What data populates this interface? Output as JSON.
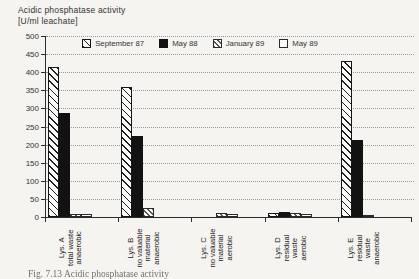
{
  "page": {
    "background": "#f5f4f0",
    "caption_fragment": "Fig. 7.13  Acidic phosphatase activity"
  },
  "chart_data": {
    "type": "bar",
    "title_line1": "Acidic phosphatase activity",
    "title_line2": "[U/ml leachate]",
    "ylabel": "",
    "xlabel": "",
    "ylim": [
      0,
      500
    ],
    "ytick_step": 50,
    "grid": "horizontal-dotted",
    "legend_position": "top-inside",
    "axis_color": "#2b2b2b",
    "grid_color": "#9a9a96",
    "categories": [
      {
        "lines": [
          "Lys. A",
          "total waste",
          "anaerobic"
        ]
      },
      {
        "lines": [
          "Lys. B",
          "no valuable",
          "material",
          "anaerobic"
        ]
      },
      {
        "lines": [
          "Lys. C",
          "no valuable",
          "material",
          "aerobic"
        ]
      },
      {
        "lines": [
          "Lys. D",
          "residual",
          "waste",
          "aerobic"
        ]
      },
      {
        "lines": [
          "Lys. E",
          "residual",
          "waste",
          "anaerobic"
        ]
      }
    ],
    "series": [
      {
        "name": "September 87",
        "pattern": "diagonal-hatch",
        "color": "#1e1e1e",
        "values": [
          415,
          360,
          0,
          10,
          430
        ]
      },
      {
        "name": "May 88",
        "pattern": "solid",
        "color": "#121212",
        "values": [
          288,
          225,
          0,
          15,
          213
        ]
      },
      {
        "name": "January 89",
        "pattern": "diagonal-hatch-fine",
        "color": "#555555",
        "values": [
          8,
          25,
          10,
          10,
          4
        ]
      },
      {
        "name": "May 89",
        "pattern": "open",
        "color": "#ffffff",
        "values": [
          8,
          0,
          8,
          8,
          0
        ]
      }
    ]
  }
}
